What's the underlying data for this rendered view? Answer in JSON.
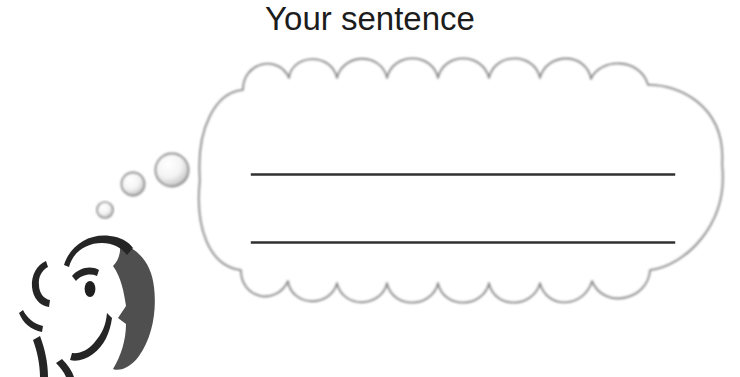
{
  "page": {
    "title": "Your sentence",
    "background_color": "#ffffff",
    "width": 740,
    "height": 377
  },
  "illustration": {
    "name": "thinking-person-with-thought-bubble",
    "thought_bubble": {
      "name": "thought-bubble",
      "outline_color": "#8a8a8a",
      "fill_color": "#ffffff",
      "scallops_top": 7,
      "scallops_bottom": 7
    },
    "thought_dots": [
      {
        "name": "thought-dot-small",
        "cx": 105,
        "cy": 210,
        "r": 8
      },
      {
        "name": "thought-dot-medium",
        "cx": 133,
        "cy": 184,
        "r": 11.5
      },
      {
        "name": "thought-dot-large",
        "cx": 172,
        "cy": 170,
        "r": 16.5
      }
    ],
    "head": {
      "name": "person-head-profile",
      "outline_color": "#2b2b2b",
      "shading_color": "#4a4a4a",
      "facing": "left"
    },
    "writing_lines": [
      {
        "name": "writing-line-1",
        "x1": 252,
        "y1": 174,
        "x2": 674,
        "y2": 174
      },
      {
        "name": "writing-line-2",
        "x1": 252,
        "y1": 242,
        "x2": 674,
        "y2": 242
      }
    ],
    "line_color": "#2b2b2b"
  }
}
